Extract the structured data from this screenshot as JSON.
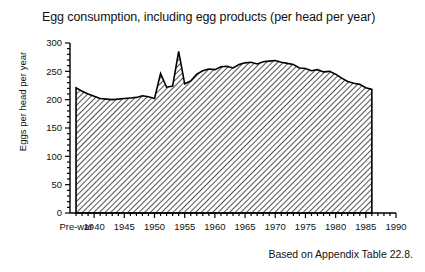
{
  "chart_data": {
    "type": "area",
    "title": "Egg consumption, including egg products (per head per year)",
    "xlabel": "",
    "ylabel": "Eggs per head per year",
    "caption": "Based on Appendix Table 22.8.",
    "ylim": [
      0,
      300
    ],
    "xlim": [
      1936,
      1990
    ],
    "ytick_values": [
      0,
      50,
      100,
      150,
      200,
      250,
      300
    ],
    "ytick_labels": [
      "0",
      "50",
      "100",
      "150",
      "200",
      "250",
      "300"
    ],
    "yminor_step": 10,
    "xtick_values": [
      1937,
      1940,
      1945,
      1950,
      1955,
      1960,
      1965,
      1970,
      1975,
      1980,
      1985,
      1990
    ],
    "xtick_labels": [
      "Pre-war",
      "1940",
      "1945",
      "1950",
      "1955",
      "1960",
      "1965",
      "1970",
      "1975",
      "1980",
      "1985",
      "1990"
    ],
    "xminor_step": 1,
    "grid": false,
    "legend": null,
    "fill_pattern": "diagonal-hatch",
    "fill_color": "#ffffff",
    "line_color": "#000000",
    "x": [
      1937,
      1938,
      1939,
      1940,
      1941,
      1942,
      1943,
      1944,
      1945,
      1946,
      1947,
      1948,
      1949,
      1950,
      1951,
      1952,
      1953,
      1954,
      1955,
      1956,
      1957,
      1958,
      1959,
      1960,
      1961,
      1962,
      1963,
      1964,
      1965,
      1966,
      1967,
      1968,
      1969,
      1970,
      1971,
      1972,
      1973,
      1974,
      1975,
      1976,
      1977,
      1978,
      1979,
      1980,
      1981,
      1982,
      1983,
      1984,
      1985,
      1986
    ],
    "values": [
      221,
      215,
      210,
      206,
      202,
      201,
      200,
      201,
      202,
      203,
      204,
      207,
      205,
      202,
      246,
      222,
      224,
      285,
      228,
      233,
      245,
      251,
      254,
      253,
      258,
      259,
      256,
      262,
      265,
      266,
      263,
      267,
      268,
      269,
      266,
      264,
      262,
      256,
      255,
      251,
      253,
      249,
      250,
      245,
      238,
      232,
      229,
      227,
      221,
      218
    ],
    "series_start_year": 1937,
    "series_end_year": 1986
  }
}
